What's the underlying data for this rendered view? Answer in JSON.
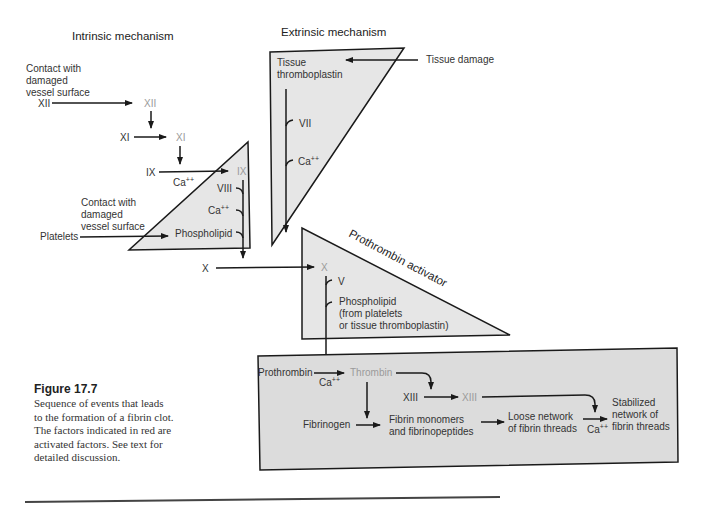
{
  "headings": {
    "intrinsic": "Intrinsic mechanism",
    "extrinsic": "Extrinsic mechanism",
    "prothrombin_activator": "Prothrombin activator"
  },
  "intrinsic": {
    "contact_label_1": [
      "Contact with",
      "damaged",
      "vessel surface"
    ],
    "xii": "XII",
    "xii_active": "XII",
    "xi": "XI",
    "xi_active": "XI",
    "ix": "IX",
    "ix_active": "IX",
    "ca_ix": "Ca",
    "contact_label_2": [
      "Contact with",
      "damaged",
      "vessel surface"
    ],
    "platelets": "Platelets",
    "viii": "VIII",
    "ca_tri": "Ca",
    "phospholipid": "Phospholipid"
  },
  "extrinsic": {
    "tissue_thromboplastin": [
      "Tissue",
      "thromboplastin"
    ],
    "tissue_damage": "Tissue damage",
    "vii": "VII",
    "ca": "Ca"
  },
  "activator": {
    "x": "X",
    "x_active": "X",
    "v": "V",
    "phospholipid": [
      "Phospholipid",
      "(from platelets",
      "or tissue thromboplastin)"
    ]
  },
  "clot": {
    "prothrombin": "Prothrombin",
    "ca": "Ca",
    "thrombin": "Thrombin",
    "xiii": "XIII",
    "xiii_active": "XIII",
    "fibrinogen": "Fibrinogen",
    "fibrin_monomers": [
      "Fibrin monomers",
      "and fibrinopeptides"
    ],
    "loose_network": [
      "Loose network",
      "of fibrin threads"
    ],
    "ca2": "Ca",
    "stabilized": [
      "Stabilized",
      "network of",
      "fibrin threads"
    ]
  },
  "superscript": "++",
  "caption": {
    "title": "Figure 17.7",
    "body": "Sequence of events that leads to the formation of a fibrin clot. The factors indicated in red are activated factors. See text for detailed discussion."
  },
  "colors": {
    "panel_fill": "#e6e6e6",
    "clot_box_fill": "#dcdcdc",
    "activated_factor": "#9a9a9a",
    "text": "#333333",
    "line": "#1a1a1a"
  }
}
